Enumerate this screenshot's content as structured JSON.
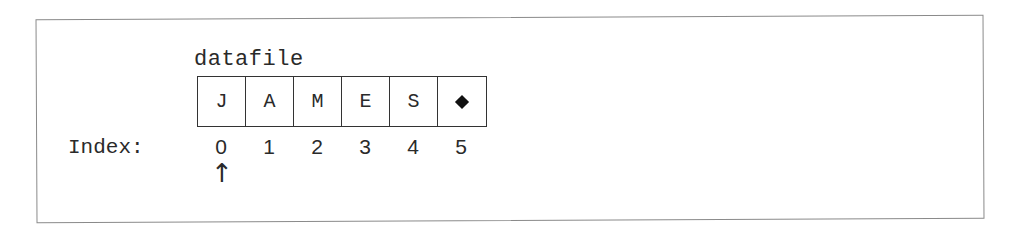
{
  "diagram": {
    "array_name": "datafile",
    "cells": [
      {
        "value": "J",
        "type": "char"
      },
      {
        "value": "A",
        "type": "char"
      },
      {
        "value": "M",
        "type": "char"
      },
      {
        "value": "E",
        "type": "char"
      },
      {
        "value": "S",
        "type": "char"
      },
      {
        "value": "",
        "type": "eof-marker",
        "icon": "diamond-icon"
      }
    ],
    "index_label": "Index:",
    "indices": [
      "0",
      "1",
      "2",
      "3",
      "4",
      "5"
    ],
    "pointer": {
      "symbol": "↑",
      "position_index": 0
    }
  }
}
